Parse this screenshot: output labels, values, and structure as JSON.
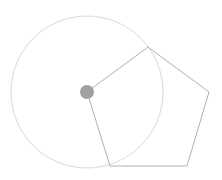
{
  "diagram": {
    "background": "#ffffff",
    "circle": {
      "cx": 87,
      "cy": 92,
      "r": 76,
      "stroke": "#d8d8d8"
    },
    "pentagon": {
      "points": "87,92 148,47 209,92 187,166 110,166",
      "stroke": "#b0b0b0"
    },
    "center_dot": {
      "cx": 87,
      "cy": 92,
      "r": 7,
      "fill": "#a0a0a0"
    }
  }
}
